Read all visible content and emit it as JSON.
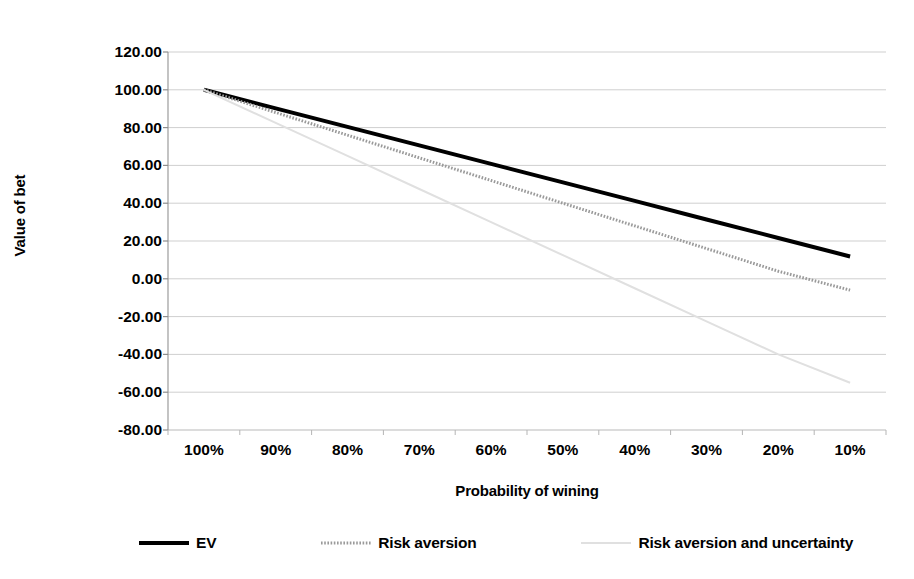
{
  "chart_data": {
    "type": "line",
    "title": "",
    "xlabel": "Probability of wining",
    "ylabel": "Value of bet",
    "categories": [
      "100%",
      "90%",
      "80%",
      "70%",
      "60%",
      "50%",
      "40%",
      "30%",
      "20%",
      "10%"
    ],
    "ylim": [
      -80,
      120
    ],
    "ytick_labels": [
      "120.00",
      "100.00",
      "80.00",
      "60.00",
      "40.00",
      "20.00",
      "0.00",
      "-20.00",
      "-40.00",
      "-60.00",
      "-80.00"
    ],
    "ytick_values": [
      120,
      100,
      80,
      60,
      40,
      20,
      0,
      -20,
      -40,
      -60,
      -80
    ],
    "grid": true,
    "legend_position": "bottom",
    "series": [
      {
        "name": "EV",
        "color": "#000000",
        "style": "solid",
        "width": 4,
        "values": [
          100,
          90.2,
          80.4,
          70.6,
          60.8,
          51,
          41.2,
          31.4,
          21.6,
          11.8
        ]
      },
      {
        "name": "Risk aversion",
        "color": "#9a9a9a",
        "style": "dotted",
        "width": 3,
        "values": [
          100,
          88,
          76,
          64,
          52,
          40,
          28,
          16,
          4,
          -6
        ]
      },
      {
        "name": "Risk aversion and uncertainty",
        "color": "#e0e0e0",
        "style": "solid",
        "width": 2,
        "values": [
          100,
          82.5,
          65,
          47.5,
          30,
          12.5,
          -5,
          -22.5,
          -40,
          -55
        ]
      }
    ]
  },
  "axes": {
    "y_title": "Value of bet",
    "x_title": "Probability of wining"
  },
  "legend": {
    "items": [
      {
        "label": "EV"
      },
      {
        "label": "Risk aversion"
      },
      {
        "label": "Risk aversion and uncertainty"
      }
    ]
  }
}
